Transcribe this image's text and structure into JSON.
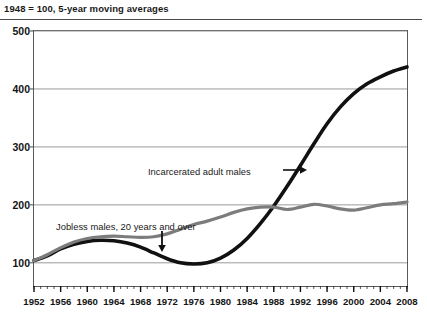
{
  "header": {
    "title": "1948 = 100, 5-year moving averages"
  },
  "chart_data": {
    "type": "line",
    "title": "1948 = 100, 5-year moving averages",
    "xlabel": "",
    "ylabel": "",
    "xlim": [
      1952,
      2008
    ],
    "ylim": [
      60,
      500
    ],
    "grid": true,
    "legend_position": "inline-annotations",
    "yticks": [
      100,
      200,
      300,
      400,
      500
    ],
    "ytick_labels": [
      "100",
      "200",
      "300",
      "400",
      "500"
    ],
    "xticks": [
      1952,
      1956,
      1960,
      1964,
      1968,
      1972,
      1976,
      1980,
      1984,
      1988,
      1992,
      1996,
      2000,
      2004,
      2008
    ],
    "xtick_labels": [
      "1952",
      "1956",
      "1960",
      "1964",
      "1968",
      "1972",
      "1976",
      "1980",
      "1984",
      "1988",
      "1992",
      "1996",
      "2000",
      "2004",
      "2008"
    ],
    "minor_xtick_interval": 1,
    "x": [
      1952,
      1954,
      1956,
      1958,
      1960,
      1962,
      1964,
      1966,
      1968,
      1970,
      1972,
      1974,
      1976,
      1978,
      1980,
      1982,
      1984,
      1986,
      1988,
      1990,
      1992,
      1994,
      1996,
      1998,
      2000,
      2002,
      2004,
      2006,
      2008
    ],
    "series": [
      {
        "name": "Incarcerated adult males",
        "color": "#111111",
        "width": 3.6,
        "values": [
          104,
          112,
          124,
          132,
          137,
          139,
          138,
          134,
          127,
          117,
          107,
          100,
          98,
          100,
          108,
          122,
          142,
          168,
          198,
          232,
          268,
          305,
          340,
          369,
          392,
          409,
          421,
          431,
          438
        ]
      },
      {
        "name": "Jobless males, 20 years and over",
        "color": "#7c7c7c",
        "width": 3.2,
        "values": [
          104,
          114,
          126,
          136,
          142,
          145,
          146,
          145,
          144,
          145,
          150,
          158,
          166,
          172,
          179,
          187,
          193,
          196,
          196,
          192,
          196,
          201,
          198,
          193,
          191,
          195,
          200,
          202,
          205
        ]
      }
    ],
    "annotations": [
      {
        "id": "incarcerated-label",
        "text": "Incarcerated adult males",
        "arrow": "right-arrow",
        "points_to_series": "Incarcerated adult males"
      },
      {
        "id": "jobless-label",
        "text": "Jobless males, 20 years and over",
        "arrow": "down-arrow",
        "points_to_series": "Jobless males, 20 years and over"
      }
    ]
  }
}
